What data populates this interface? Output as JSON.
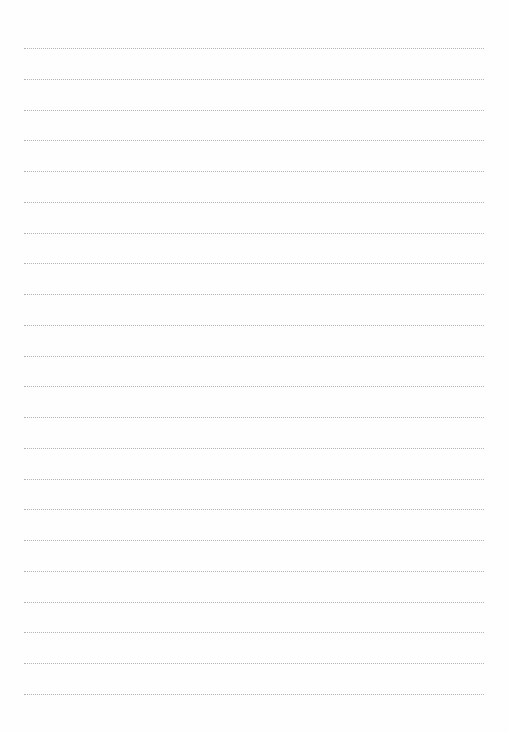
{
  "document": {
    "type": "lined-paper",
    "line_count": 22,
    "line_style": "dotted",
    "line_color": "#b4b4b4",
    "background_color": "#fefefe",
    "text": []
  }
}
